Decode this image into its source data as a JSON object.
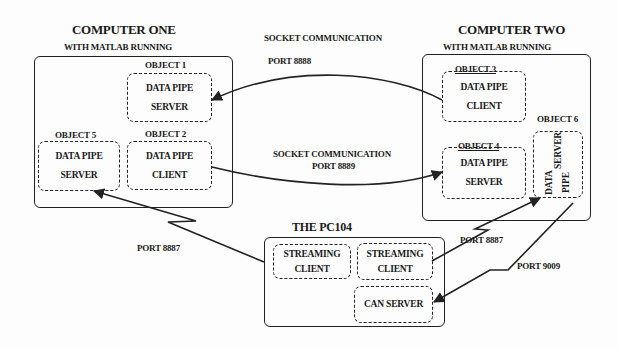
{
  "computer_one": {
    "title": "COMPUTER ONE",
    "subtitle": "WITH MATLAB RUNNING",
    "objects": [
      {
        "label": "OBJECT 1",
        "line1": "DATA PIPE",
        "line2": "SERVER"
      },
      {
        "label": "OBJECT 2",
        "line1": "DATA PIPE",
        "line2": "CLIENT"
      },
      {
        "label": "OBJECT 5",
        "line1": "DATA PIPE",
        "line2": "SERVER"
      }
    ]
  },
  "computer_two": {
    "title": "COMPUTER TWO",
    "subtitle": "WITH MATLAB RUNNING",
    "objects": [
      {
        "label": "OBJECT 3",
        "line1": "DATA PIPE",
        "line2": "CLIENT"
      },
      {
        "label": "OBJECT 4",
        "line1": "DATA PIPE",
        "line2": "SERVER"
      },
      {
        "label": "OBJECT 6",
        "line1": "DATA PIPE",
        "line2": "SERVER"
      }
    ]
  },
  "pc104": {
    "title": "THE PC104",
    "components": [
      {
        "line1": "STREAMING",
        "line2": "CLIENT"
      },
      {
        "line1": "STREAMING",
        "line2": "CLIENT"
      },
      {
        "line1": "CAN SERVER"
      }
    ]
  },
  "connections": {
    "socket_8888": {
      "line1": "SOCKET COMMUNICATION",
      "line2": "PORT 8888"
    },
    "socket_8889": {
      "line1": "SOCKET COMMUNICATION",
      "line2": "PORT 8889"
    },
    "port_8887_left": "PORT 8887",
    "port_8887_right": "PORT 8887",
    "port_9009": "PORT 9009"
  }
}
